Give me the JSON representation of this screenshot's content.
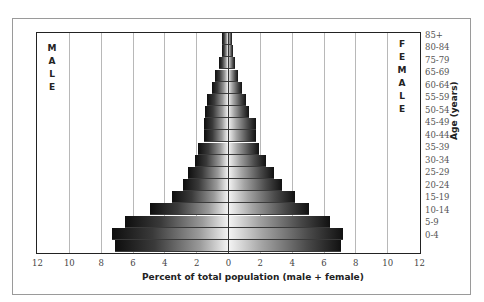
{
  "chart_data": {
    "type": "bar",
    "orientation": "horizontal",
    "subtype": "population-pyramid",
    "title": "",
    "xlabel": "Percent of total population (male + female)",
    "ylabel": "Age (years)",
    "xlim": [
      -12,
      12
    ],
    "x_ticks": [
      12,
      10,
      8,
      6,
      4,
      2,
      0,
      2,
      4,
      6,
      8,
      10,
      12
    ],
    "grid": true,
    "side_labels": {
      "left": "MALE",
      "right": "FEMALE"
    },
    "categories": [
      "85+",
      "80-84",
      "75-79",
      "70-74",
      "65-69",
      "60-64",
      "55-59",
      "50-54",
      "45-49",
      "40-44",
      "35-39",
      "30-34",
      "25-29",
      "20-24",
      "15-19",
      "10-14",
      "5-9",
      "0-4"
    ],
    "y_tick_labels_shown": [
      "85+",
      "80-84",
      "75-79",
      "65-69",
      "60-64",
      "55-59",
      "50-54",
      "45-49",
      "40-44",
      "35-39",
      "30-34",
      "25-29",
      "20-24",
      "15-19",
      "10-14",
      "5-9",
      "0-4"
    ],
    "series": [
      {
        "name": "Male",
        "values": [
          0.35,
          0.4,
          0.55,
          0.8,
          1.0,
          1.35,
          1.45,
          1.5,
          1.5,
          1.9,
          2.1,
          2.5,
          2.8,
          3.5,
          4.9,
          6.5,
          7.3,
          7.1
        ]
      },
      {
        "name": "Female",
        "values": [
          0.25,
          0.3,
          0.45,
          0.65,
          0.9,
          1.1,
          1.3,
          1.75,
          1.75,
          1.95,
          2.4,
          2.9,
          3.4,
          4.2,
          5.1,
          6.4,
          7.2,
          7.1
        ]
      }
    ]
  }
}
